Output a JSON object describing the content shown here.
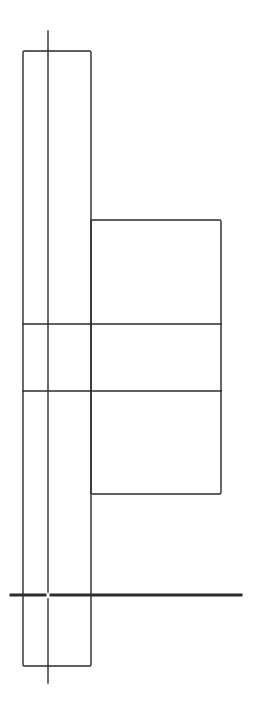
{
  "diagram": {
    "width": 253,
    "height": 708,
    "background": "#ffffff",
    "stroke": "#2b2b2b",
    "stroke_width": 1.4,
    "ground_stroke_width": 3,
    "shapes": {
      "tall_rect": {
        "x": 23,
        "y": 51,
        "w": 68,
        "h": 615
      },
      "center_line": {
        "x": 48,
        "y1": 31,
        "y2": 683
      },
      "side_rect": {
        "x": 91,
        "y": 220,
        "w": 130,
        "h": 274
      },
      "h_line_upper": {
        "x1": 23,
        "x2": 221,
        "y": 324
      },
      "h_line_lower": {
        "x1": 23,
        "x2": 221,
        "y": 391
      },
      "ground_line": {
        "x1": 11,
        "x2": 241,
        "y": 595,
        "gap_at_x": 48
      }
    }
  }
}
